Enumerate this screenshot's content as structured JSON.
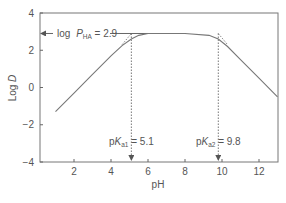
{
  "chart_data": {
    "type": "line",
    "title": "",
    "xlabel": "pH",
    "ylabel": "Log D",
    "xlim": [
      0,
      13.5
    ],
    "ylim": [
      -4,
      4
    ],
    "xticks": [
      2,
      4,
      6,
      8,
      10,
      12
    ],
    "yticks": [
      4,
      2,
      0,
      -2,
      -4
    ],
    "ytick_labels": [
      "4",
      "2",
      "0",
      "−2",
      "−4"
    ],
    "grid": false,
    "series": [
      {
        "name": "log D profile",
        "style": "solid",
        "x": [
          1.0,
          2.0,
          3.0,
          4.0,
          4.6,
          5.1,
          5.5,
          6.0,
          8.0,
          9.3,
          9.8,
          10.3,
          11.0,
          12.0,
          13.0
        ],
        "y": [
          -1.3,
          -0.3,
          0.7,
          1.7,
          2.25,
          2.6,
          2.8,
          2.9,
          2.9,
          2.8,
          2.6,
          2.2,
          1.5,
          0.5,
          -0.5
        ]
      },
      {
        "name": "asymptotes",
        "style": "dotted",
        "x": [
          4.6,
          5.1,
          9.8,
          10.3
        ],
        "y": [
          2.3,
          2.9,
          2.9,
          2.3
        ]
      }
    ],
    "annotations": [
      {
        "id": "logP",
        "prefix": "log ",
        "italic": "P",
        "sub": "HA",
        "suffix": " = 2.9",
        "y": 2.9,
        "arrow": "left-to-axis"
      },
      {
        "id": "pKa1",
        "prefix": "p",
        "italic": "K",
        "sub": "a1",
        "suffix": " = 5.1",
        "x": 5.1,
        "arrow": "down-dashed"
      },
      {
        "id": "pKa2",
        "prefix": "p",
        "italic": "K",
        "sub": "a2",
        "suffix": " = 9.8",
        "x": 9.8,
        "arrow": "down-dashed"
      }
    ],
    "colors": {
      "line": "#777777",
      "axis": "#666666",
      "text": "#555555"
    }
  }
}
